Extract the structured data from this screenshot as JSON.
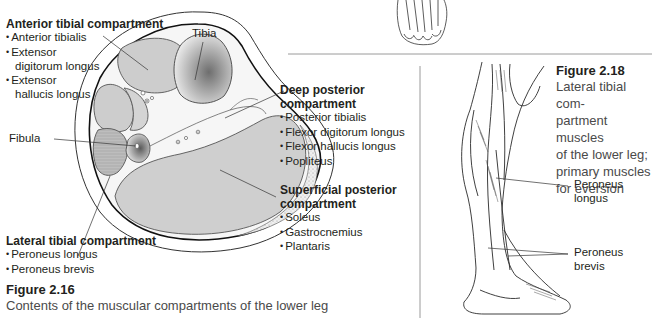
{
  "figure_2_16": {
    "title": "Figure 2.16",
    "caption": "Contents of the muscular compartments of the lower leg",
    "anterior": {
      "heading": "Anterior tibial compartment",
      "items": [
        "Anterior tibialis",
        "Extensor",
        "digitorum longus",
        "Extensor",
        "hallucis longus"
      ]
    },
    "tibia_label": "Tibia",
    "fibula_label": "Fibula",
    "deep_posterior": {
      "heading_line1": "Deep posterior",
      "heading_line2": "compartment",
      "items": [
        "Posterior tibialis",
        "Flexor digitorum longus",
        "Flexor hallucis longus",
        "Popliteus"
      ]
    },
    "superficial_posterior": {
      "heading_line1": "Superficial posterior",
      "heading_line2": "compartment",
      "items": [
        "Soleus",
        "Gastrocnemius",
        "Plantaris"
      ]
    },
    "lateral": {
      "heading": "Lateral tibial compartment",
      "items": [
        "Peroneus longus",
        "Peroneus brevis"
      ]
    }
  },
  "figure_2_18": {
    "title": "Figure 2.18",
    "caption_lines": [
      "Lateral tibial com-",
      "partment muscles",
      "of the lower leg;",
      "primary muscles",
      "for eversion"
    ],
    "labels": {
      "peroneus_longus_1": "Peroneus",
      "peroneus_longus_2": "longus",
      "peroneus_brevis_1": "Peroneus",
      "peroneus_brevis_2": "brevis"
    }
  }
}
